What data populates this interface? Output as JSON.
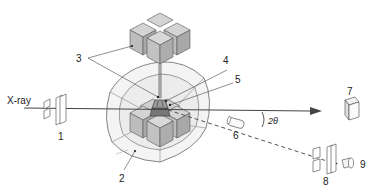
{
  "diagram": {
    "beam_label": "X-ray",
    "angle_label": "2θ",
    "callouts": [
      {
        "id": "1",
        "label": "1",
        "component": "incident-slits"
      },
      {
        "id": "2",
        "label": "2",
        "component": "outer-anvil-guide-block"
      },
      {
        "id": "3",
        "label": "3",
        "component": "inner-anvils"
      },
      {
        "id": "4",
        "label": "4",
        "component": "sample-assembly"
      },
      {
        "id": "5",
        "label": "5",
        "component": "sample"
      },
      {
        "id": "6",
        "label": "6",
        "component": "energy-dispersive-detector"
      },
      {
        "id": "7",
        "label": "7",
        "component": "transmitted-beam-detector"
      },
      {
        "id": "8",
        "label": "8",
        "component": "receiving-slits"
      },
      {
        "id": "9",
        "label": "9",
        "component": "diffraction-detector"
      }
    ],
    "colors": {
      "line": "#444444",
      "cube_face_top": "#d4d4d4",
      "cube_face_left": "#bdbdbd",
      "cube_face_right": "#a8a8a8",
      "guide_fill": "#f2f2f2",
      "guide_inner": "#e6e6e6"
    }
  }
}
